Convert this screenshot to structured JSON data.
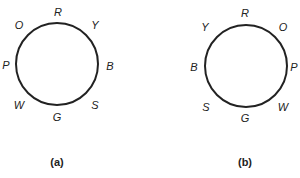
{
  "diagrams": [
    {
      "caption": "(a)",
      "labels": {
        "top": "R",
        "top_right": "Y",
        "right": "B",
        "bottom_right": "S",
        "bottom": "G",
        "bottom_left": "W",
        "left": "P",
        "top_left": "O"
      }
    },
    {
      "caption": "(b)",
      "labels": {
        "top": "R",
        "top_right": "O",
        "right": "P",
        "bottom_right": "W",
        "bottom": "G",
        "bottom_left": "S",
        "left": "B",
        "top_left": "Y"
      }
    }
  ]
}
